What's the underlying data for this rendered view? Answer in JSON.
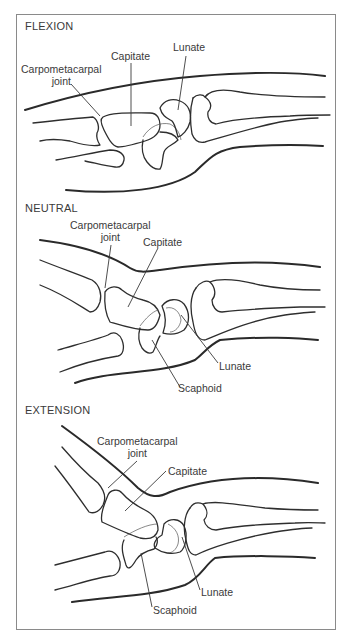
{
  "figure": {
    "panels": [
      {
        "title": "FLEXION",
        "labels": {
          "carpometacarpal_line1": "Carpometacarpal",
          "carpometacarpal_line2": "joint",
          "capitate": "Capitate",
          "lunate": "Lunate"
        }
      },
      {
        "title": "NEUTRAL",
        "labels": {
          "carpometacarpal_line1": "Carpometacarpal",
          "carpometacarpal_line2": "joint",
          "capitate": "Capitate",
          "lunate": "Lunate",
          "scaphoid": "Scaphoid"
        }
      },
      {
        "title": "EXTENSION",
        "labels": {
          "carpometacarpal_line1": "Carpometacarpal",
          "carpometacarpal_line2": "joint",
          "capitate": "Capitate",
          "lunate": "Lunate",
          "scaphoid": "Scaphoid"
        }
      }
    ]
  }
}
